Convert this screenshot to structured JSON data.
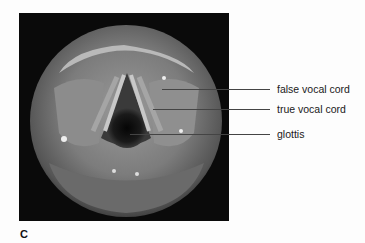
{
  "figure": {
    "panel_letter": "C",
    "image_description": "endoscopic view of the larynx",
    "labels": [
      {
        "text": "false vocal cord",
        "target": "false-vocal-cord"
      },
      {
        "text": "true vocal cord",
        "target": "true-vocal-cord"
      },
      {
        "text": "glottis",
        "target": "glottis"
      }
    ]
  }
}
